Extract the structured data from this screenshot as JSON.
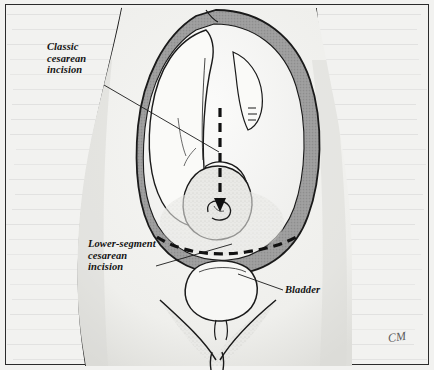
{
  "figure": {
    "kind": "medical-illustration",
    "artist_signature": "CM"
  },
  "labels": {
    "classic": "Classic\ncesarean\nincision",
    "lower_segment": "Lower-segment\ncesarean\nincision",
    "bladder": "Bladder"
  },
  "colors": {
    "paper": "#f2f2f0",
    "ink": "#1a1a1a",
    "uterus_wall": "#9a9a9a",
    "border": "#2b2b2b",
    "skin_shadow": "#cfcfcb"
  },
  "anatomy": {
    "uterus_wall_label": "uterine wall",
    "fetus_label": "fetus in cephalic presentation",
    "bladder_label": "urinary bladder",
    "umbilicus_label": "umbilicus"
  },
  "incisions": {
    "classic_orientation": "vertical midline",
    "lower_segment_orientation": "transverse low"
  }
}
